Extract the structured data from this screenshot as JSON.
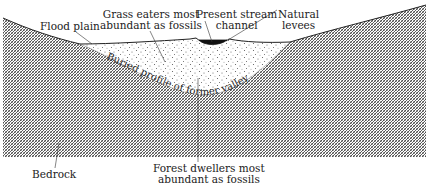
{
  "figure": {
    "type": "geologic-cross-section",
    "colors": {
      "background": "#ffffff",
      "ink": "#222222",
      "hatch": "#3a3a3a",
      "channel_water": "#111111",
      "sediment_dots": "#555555"
    }
  },
  "labels": {
    "flood_plain": "Flood plain",
    "grass_eaters": {
      "line1": "Grass eaters most",
      "line2": "abundant as fossils"
    },
    "present_stream": {
      "line1": "Present stream",
      "line2": "channel"
    },
    "natural_levees": {
      "line1": "Natural",
      "line2": "levees"
    },
    "buried_profile": "Buried profile of former valley",
    "bedrock": "Bedrock",
    "forest_dwellers": {
      "line1": "Forest dwellers most",
      "line2": "abundant as fossils"
    }
  },
  "layers": [
    {
      "name": "Bedrock",
      "pattern": "cross-hatch"
    },
    {
      "name": "Valley fill sediment",
      "pattern": "stipple"
    },
    {
      "name": "Present stream channel",
      "pattern": "solid-black"
    }
  ]
}
